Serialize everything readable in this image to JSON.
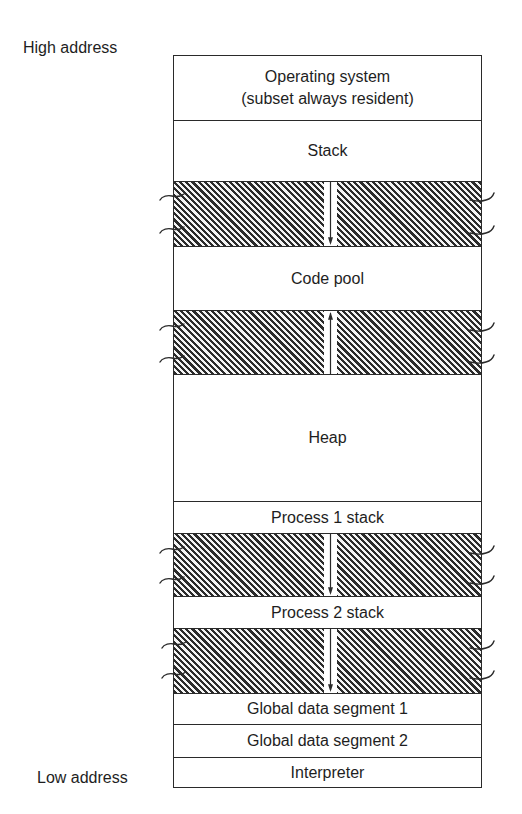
{
  "labels": {
    "high_address": "High address",
    "low_address": "Low address"
  },
  "regions": [
    {
      "id": "operating-system",
      "lines": [
        "Operating system",
        "(subset always resident)"
      ],
      "top": 0,
      "height": 64
    },
    {
      "id": "stack",
      "label": "Stack",
      "top": 64,
      "height": 61
    },
    {
      "id": "code-pool",
      "label": "Code pool",
      "top": 190,
      "height": 64
    },
    {
      "id": "heap",
      "label": "Heap",
      "top": 318,
      "height": 127
    },
    {
      "id": "process-1-stack",
      "label": "Process 1 stack",
      "top": 445,
      "height": 32
    },
    {
      "id": "process-2-stack",
      "label": "Process 2 stack",
      "top": 540,
      "height": 32
    },
    {
      "id": "global-data-segment-1",
      "label": "Global data segment 1",
      "top": 637,
      "height": 31
    },
    {
      "id": "global-data-segment-2",
      "label": "Global data segment 2",
      "top": 668,
      "height": 33
    },
    {
      "id": "interpreter",
      "label": "Interpreter",
      "top": 701,
      "height": 30
    }
  ],
  "free_gaps": [
    {
      "id": "gap-stack-code",
      "top": 125,
      "height": 65,
      "arrow": "down"
    },
    {
      "id": "gap-code-heap",
      "top": 254,
      "height": 64,
      "arrow": "up"
    },
    {
      "id": "gap-p1-p2",
      "top": 477,
      "height": 63,
      "arrow": "down"
    },
    {
      "id": "gap-p2-global",
      "top": 572,
      "height": 65,
      "arrow": "down"
    }
  ],
  "colors": {
    "line": "#2a2a2a",
    "hatch_dark": "#2b2b2b",
    "hatch_light": "#f4f4f4",
    "background": "#ffffff",
    "text": "#1e1e1e"
  }
}
